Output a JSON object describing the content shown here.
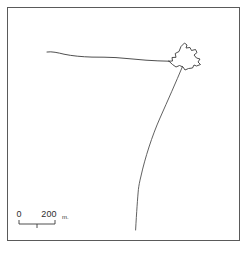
{
  "figure": {
    "kind": "line-map-drawing",
    "background_color": "#ffffff",
    "border_color": "#5a5a5a",
    "ink_color": "#3b3b3b",
    "frame": {
      "x": 7,
      "y": 7,
      "width": 233,
      "height": 234
    }
  },
  "scale_bar": {
    "start_label": "0",
    "end_label": "200",
    "unit_label": "m.",
    "bar": {
      "x": 19,
      "y": 224,
      "length": 36,
      "tick_height": 4,
      "midpoint_tick": true
    }
  },
  "features": [
    {
      "name": "coastline-shore-line",
      "description": "gently undulating near-horizontal line running from left toward the polygon",
      "path": "M 47 52 C 52 51.2 58 52.8 64 54.2 C 72 55.9 82 56.8 92 57.1 C 100 57.3 108 57.0 116 57.6 C 126 58.3 136 59.4 146 60.2 C 154 60.8 162 61.0 169 61.2"
    },
    {
      "name": "island-polygon-outline",
      "description": "closed jagged star/crown shaped outline at upper right",
      "path": "M 169 61.2 L 172.5 61.0 L 172.0 57.5 L 176.0 57.3 L 175.2 53.5 L 179.0 51.5 L 181.0 46.5 L 184.5 43.0 L 187.0 45.0 L 186.0 48.0 L 190.0 47.5 L 191.5 50.5 L 195.5 49.5 L 197.0 52.5 L 194.0 55.0 L 196.5 58.0 L 200.0 59.0 L 198.0 62.0 L 200.5 64.5 L 196.5 66.0 L 194.0 65.0 L 192.5 68.0 L 188.5 68.5 L 185.0 70.0 L 183.0 67.0 L 179.5 65.5 L 176.0 67.0 L 172.5 64.5 L 169 61.2 Z"
    },
    {
      "name": "channel-river-line",
      "description": "long line descending from the polygon down-left, bending to near-vertical at bottom",
      "path": "M 182.5 66.5 C 176 82 168 100 160 118 C 152 136 145 158 141 176 C 139.5 182 138.8 186 138.4 189.5 C 137.6 198 136.6 212 135.6 230"
    }
  ]
}
